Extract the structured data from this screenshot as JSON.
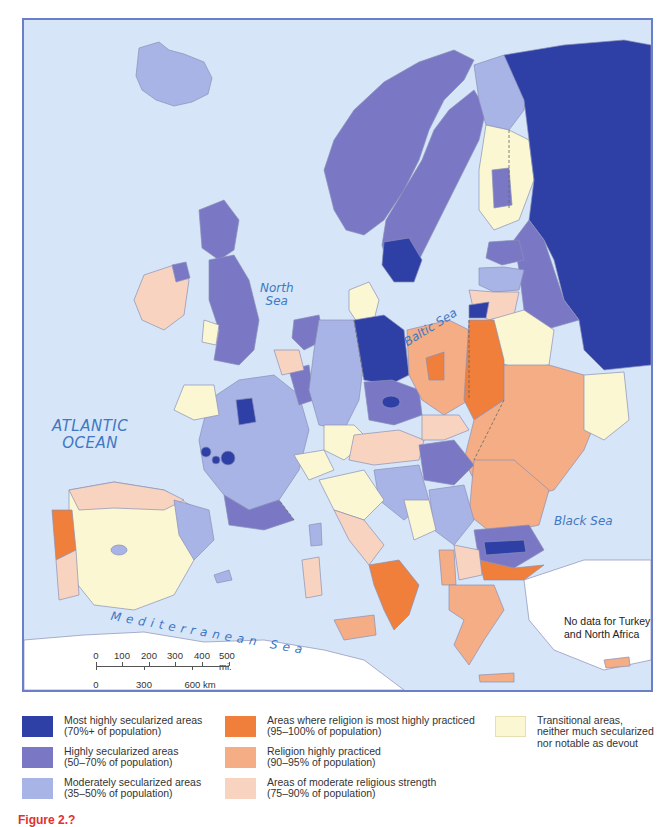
{
  "map": {
    "title": "Secularization and religious practice in Europe",
    "sea_labels": {
      "atlantic": [
        "ATLANTIC",
        "OCEAN"
      ],
      "north_sea": [
        "North",
        "Sea"
      ],
      "baltic_sea": "Baltic Sea",
      "black_sea": "Black Sea",
      "mediterranean": "Mediterranean Sea"
    },
    "no_data_note": "No data for Turkey and North Africa",
    "no_data_lines": [
      "No data for Turkey",
      "and North Africa"
    ],
    "scale_bar": {
      "miles_ticks": [
        "0",
        "100",
        "200",
        "300",
        "400",
        "500 mi."
      ],
      "km_ticks": [
        "0",
        "300",
        "600 km"
      ]
    },
    "colors": {
      "sea": "#d6e6f8",
      "frame": "#6b7fc8",
      "most_highly_secularized": "#2e3fa6",
      "highly_secularized": "#7a78c4",
      "moderately_secularized": "#a9b4e6",
      "religion_most_practiced": "#ef7f3a",
      "religion_highly_practiced": "#f4ad84",
      "moderate_religious": "#f8d4c0",
      "transitional": "#fbf7d2",
      "no_data_land": "#ffffff",
      "label_blue": "#3f78c4"
    }
  },
  "legend": {
    "items": [
      {
        "key": "most_highly_secularized",
        "line1": "Most highly secularized areas",
        "line2": "(70%+ of population)",
        "color": "#2e3fa6"
      },
      {
        "key": "highly_secularized",
        "line1": "Highly secularized areas",
        "line2": "(50–70% of population)",
        "color": "#7a78c4"
      },
      {
        "key": "moderately_secularized",
        "line1": "Moderately secularized areas",
        "line2": "(35–50% of population)",
        "color": "#a9b4e6"
      },
      {
        "key": "religion_most_practiced",
        "line1": "Areas where religion is most highly practiced",
        "line2": "(95–100% of population)",
        "color": "#ef7f3a"
      },
      {
        "key": "religion_highly_practiced",
        "line1": "Religion highly practiced",
        "line2": "(90–95% of population)",
        "color": "#f4ad84"
      },
      {
        "key": "moderate_religious",
        "line1": "Areas of moderate religious strength",
        "line2": "(75–90% of population)",
        "color": "#f8d4c0"
      },
      {
        "key": "transitional",
        "line1": "Transitional areas,",
        "line2": "neither much secularized",
        "line3": "nor notable as devout",
        "color": "#fbf7d2"
      }
    ]
  },
  "figure_label": "Figure 2.?"
}
